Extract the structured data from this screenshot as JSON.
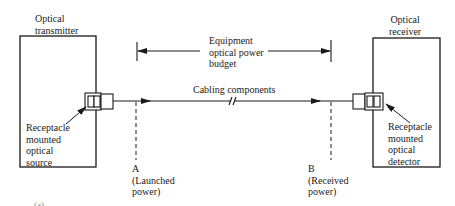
{
  "transmitter": {
    "title_line1": "Optical",
    "title_line2": "transmitter",
    "source_line1": "Receptacle",
    "source_line2": "mounted",
    "source_line3": "optical",
    "source_line4": "source"
  },
  "receiver": {
    "title_line1": "Optical",
    "title_line2": "receiver",
    "detector_line1": "Receptacle",
    "detector_line2": "mounted",
    "detector_line3": "optical",
    "detector_line4": "detector"
  },
  "budget": {
    "line1": "Equipment",
    "line2": "optical power",
    "line3": "budget"
  },
  "cabling": {
    "label": "Cabling components"
  },
  "point_a": {
    "letter": "A",
    "line1": "(Launched",
    "line2": "power)"
  },
  "point_b": {
    "letter": "B",
    "line1": "(Received",
    "line2": "power)"
  },
  "figure_label": "(a)",
  "colors": {
    "ink": "#1a1a1a",
    "background": "#ffffff"
  }
}
